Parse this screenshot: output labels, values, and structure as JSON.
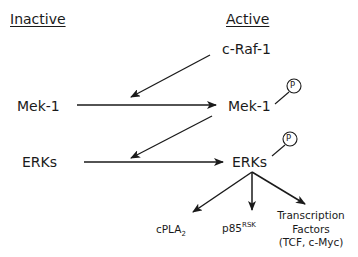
{
  "headers": {
    "inactive": "Inactive",
    "active": "Active"
  },
  "nodes": {
    "craf1": "c-Raf-1",
    "mek1_inactive": "Mek-1",
    "mek1_active": "Mek-1",
    "erks_inactive": "ERKs",
    "erks_active": "ERKs",
    "phospho_label": "P"
  },
  "targets": {
    "cpla2": {
      "base": "cPLA",
      "sub": "2"
    },
    "p85rsk": {
      "base": "p85",
      "sup": "RSK"
    },
    "transcription_factors": {
      "line1": "Transcription",
      "line2": "Factors",
      "line3": "(TCF, c-Myc)"
    }
  },
  "colors": {
    "ink": "#1a1a1a",
    "background": "#ffffff"
  }
}
